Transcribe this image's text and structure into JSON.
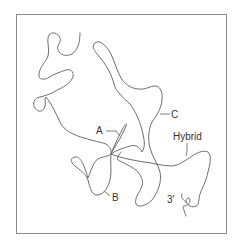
{
  "figure": {
    "type": "electron-micrograph-tracing",
    "labels": {
      "a": "A",
      "b": "B",
      "c": "C",
      "hybrid": "Hybrid",
      "three_prime": "3′"
    },
    "colors": {
      "strand": "#6e6e6e",
      "frame": "#8a8a8a",
      "text": "#333333",
      "background": "#ffffff"
    }
  }
}
